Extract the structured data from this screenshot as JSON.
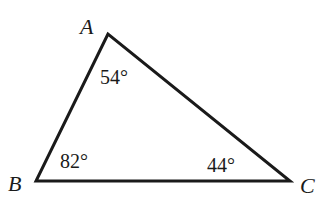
{
  "diagram": {
    "type": "triangle",
    "vertices": {
      "A": {
        "label": "A",
        "angle": "54°"
      },
      "B": {
        "label": "B",
        "angle": "82°"
      },
      "C": {
        "label": "C",
        "angle": "44°"
      }
    },
    "stroke_color": "#1a1a1a"
  }
}
